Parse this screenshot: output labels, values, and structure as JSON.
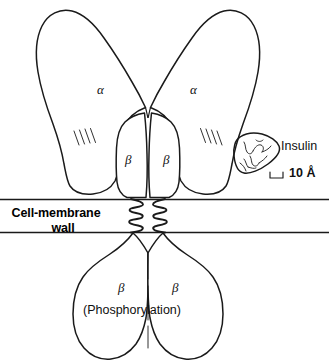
{
  "figure": {
    "kind": "insulin-receptor-schematic",
    "background_color": "#ffffff",
    "line_color": "#1a1a1a",
    "width": 329,
    "height": 364
  },
  "labels": {
    "alpha_left": "α",
    "alpha_right": "α",
    "beta_upper_left": "β",
    "beta_upper_right": "β",
    "beta_lower_left": "β",
    "beta_lower_right": "β",
    "phosphorylation": "(Phosphorylation)",
    "insulin": "Insulin",
    "scale": "10 Å",
    "membrane_line1": "Cell-membrane",
    "membrane_line2": "wall"
  },
  "structures": {
    "alpha_subunits": 2,
    "beta_subunits_extracellular": 2,
    "beta_subunits_intracellular": 2,
    "transmembrane_helices": 2,
    "hatch_marks_left": 4,
    "hatch_marks_right": 4,
    "membrane_lines": 2
  },
  "icons": {
    "insulin_blob": "insulin-molecule-icon",
    "scale_bar": "scale-bar-icon"
  }
}
